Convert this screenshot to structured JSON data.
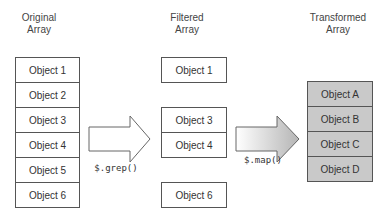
{
  "columns": {
    "original": {
      "title_line1": "Original",
      "title_line2": "Array",
      "items": [
        "Object 1",
        "Object 2",
        "Object 3",
        "Object 4",
        "Object 5",
        "Object 6"
      ]
    },
    "filtered": {
      "title_line1": "Filtered",
      "title_line2": "Array",
      "items": [
        "Object 1",
        "Object 3",
        "Object 4",
        "Object 6"
      ]
    },
    "transformed": {
      "title_line1": "Transformed",
      "title_line2": "Array",
      "items": [
        "Object A",
        "Object B",
        "Object C",
        "Object D"
      ]
    }
  },
  "arrows": {
    "grep": {
      "label": "$.grep()"
    },
    "map": {
      "label": "$.map()"
    }
  },
  "colors": {
    "border": "#555555",
    "shaded_fill": "#c9c9c9",
    "arrow_gradient_light": "#ffffff",
    "arrow_gradient_dark": "#b5b5b5"
  }
}
